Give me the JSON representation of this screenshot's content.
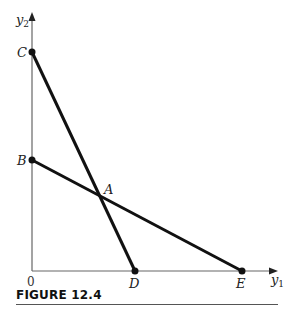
{
  "figure": {
    "caption": "FIGURE 12.4",
    "axes": {
      "x_label": "y",
      "x_label_subscript": "1",
      "y_label": "y",
      "y_label_subscript": "2",
      "origin_label": "0"
    },
    "points": {
      "A": "A",
      "B": "B",
      "C": "C",
      "D": "D",
      "E": "E"
    },
    "colors": {
      "axis": "#666666",
      "line": "#111111",
      "point": "#111111"
    }
  }
}
